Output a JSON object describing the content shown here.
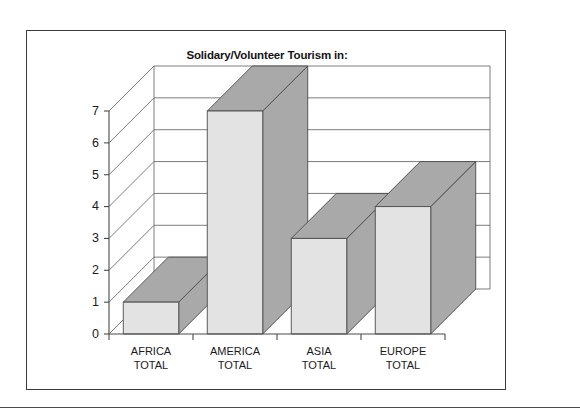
{
  "figure": {
    "title": "Solidary/Volunteer Tourism in:"
  },
  "chart_data": {
    "type": "bar",
    "title": "Solidary/Volunteer Tourism in:",
    "xlabel": "",
    "ylabel": "",
    "categories": [
      "AFRICA TOTAL",
      "AMERICA TOTAL",
      "ASIA TOTAL",
      "EUROPE TOTAL"
    ],
    "category_lines": [
      [
        "AFRICA",
        "TOTAL"
      ],
      [
        "AMERICA",
        "TOTAL"
      ],
      [
        "ASIA",
        "TOTAL"
      ],
      [
        "EUROPE",
        "TOTAL"
      ]
    ],
    "values": [
      1,
      7,
      3,
      4
    ],
    "ylim": [
      0,
      7
    ],
    "yticks": [
      0,
      1,
      2,
      3,
      4,
      5,
      6,
      7
    ],
    "ytick_labels": [
      "0",
      "1",
      "2",
      "3",
      "4",
      "5",
      "6",
      "7"
    ],
    "grid": true,
    "legend": false,
    "three_d": true,
    "colors": {
      "bar_front": "#e3e3e3",
      "bar_side": "#a9a9a9",
      "bar_top": "#a9a9a9",
      "axis": "#4a4a4a",
      "grid": "#6e6e6e",
      "frame": "#3a3a3a",
      "text": "#1a1a1a",
      "background": "#ffffff"
    }
  }
}
